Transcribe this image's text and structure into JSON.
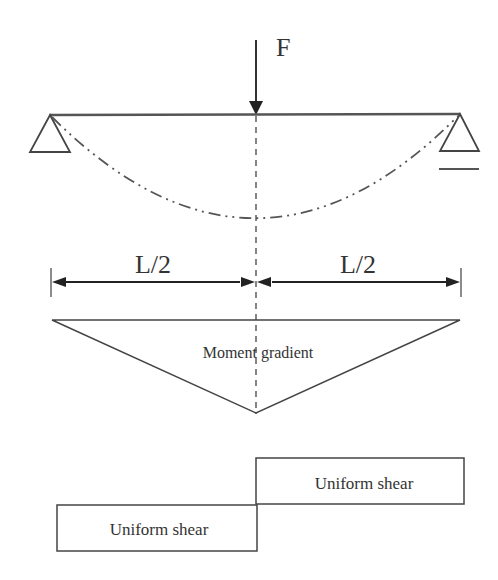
{
  "diagram": {
    "type": "simply-supported-beam-three-point-bending",
    "force": {
      "label": "F",
      "position": "midspan",
      "direction": "downward"
    },
    "beam": {
      "supports": [
        "pin (left)",
        "roller (right)"
      ],
      "deflected_shape": "dash-dot curve"
    },
    "dimensions": [
      {
        "label": "L/2",
        "side": "left"
      },
      {
        "label": "L/2",
        "side": "right"
      }
    ],
    "moment_diagram": {
      "label": "Moment gradient",
      "shape": "triangle"
    },
    "shear_diagram": {
      "segments": [
        {
          "label": "Uniform shear",
          "side": "left",
          "level": "lower"
        },
        {
          "label": "Uniform shear",
          "side": "right",
          "level": "upper"
        }
      ]
    },
    "colors": {
      "line": "#333333",
      "background": "#ffffff"
    }
  }
}
